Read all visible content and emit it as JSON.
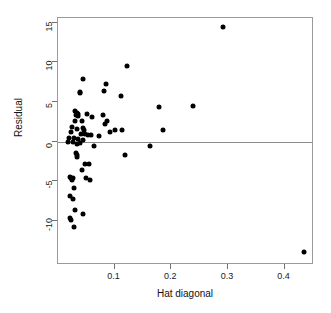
{
  "chart_data": {
    "type": "scatter",
    "title": "",
    "xlabel": "Hat diagonal",
    "ylabel": "Residual",
    "xlim": [
      0.0,
      0.452
    ],
    "ylim": [
      -15.6,
      15.6
    ],
    "xticks": [
      0.1,
      0.2,
      0.3,
      0.4
    ],
    "xtick_labels": [
      "0.1",
      "0.2",
      "0.3",
      "0.4"
    ],
    "yticks": [
      15,
      10,
      5,
      0,
      -5,
      -10
    ],
    "ytick_labels": [
      "15",
      "10",
      "5",
      "0",
      "-5",
      "-10"
    ],
    "grid": false,
    "legend": null,
    "reference_lines": [
      {
        "axis": "y",
        "value": 0,
        "color": "#8c8c8c"
      }
    ],
    "marker": {
      "shape": "circle",
      "filled": true,
      "color": "#000000",
      "size_px": 5
    },
    "points": [
      {
        "x": 0.292,
        "y": 14.5
      },
      {
        "x": 0.122,
        "y": 9.6
      },
      {
        "x": 0.045,
        "y": 7.9
      },
      {
        "x": 0.085,
        "y": 7.3
      },
      {
        "x": 0.039,
        "y": 6.2
      },
      {
        "x": 0.082,
        "y": 6.4
      },
      {
        "x": 0.039,
        "y": 6.1
      },
      {
        "x": 0.112,
        "y": 5.7
      },
      {
        "x": 0.238,
        "y": 4.5
      },
      {
        "x": 0.179,
        "y": 4.3
      },
      {
        "x": 0.03,
        "y": 3.9
      },
      {
        "x": 0.033,
        "y": 3.6
      },
      {
        "x": 0.035,
        "y": 3.5
      },
      {
        "x": 0.051,
        "y": 3.5
      },
      {
        "x": 0.032,
        "y": 3.3
      },
      {
        "x": 0.06,
        "y": 3.1
      },
      {
        "x": 0.036,
        "y": 3.2
      },
      {
        "x": 0.08,
        "y": 3.3
      },
      {
        "x": 0.03,
        "y": 2.6
      },
      {
        "x": 0.042,
        "y": 2.6
      },
      {
        "x": 0.087,
        "y": 2.6
      },
      {
        "x": 0.083,
        "y": 2.2
      },
      {
        "x": 0.024,
        "y": 1.8
      },
      {
        "x": 0.034,
        "y": 1.6
      },
      {
        "x": 0.044,
        "y": 1.7
      },
      {
        "x": 0.046,
        "y": 1.5
      },
      {
        "x": 0.1,
        "y": 1.5
      },
      {
        "x": 0.186,
        "y": 1.5
      },
      {
        "x": 0.113,
        "y": 1.5
      },
      {
        "x": 0.091,
        "y": 1.2
      },
      {
        "x": 0.023,
        "y": 1.2
      },
      {
        "x": 0.04,
        "y": 1.0
      },
      {
        "x": 0.048,
        "y": 0.9
      },
      {
        "x": 0.053,
        "y": 0.8
      },
      {
        "x": 0.058,
        "y": 0.8
      },
      {
        "x": 0.072,
        "y": 0.7
      },
      {
        "x": 0.02,
        "y": 0.5
      },
      {
        "x": 0.028,
        "y": 0.4
      },
      {
        "x": 0.035,
        "y": 0.3
      },
      {
        "x": 0.044,
        "y": 0.2
      },
      {
        "x": 0.018,
        "y": 0.0
      },
      {
        "x": 0.026,
        "y": -0.1
      },
      {
        "x": 0.033,
        "y": -0.3
      },
      {
        "x": 0.038,
        "y": -0.2
      },
      {
        "x": 0.064,
        "y": -0.6
      },
      {
        "x": 0.163,
        "y": -0.6
      },
      {
        "x": 0.031,
        "y": -1.4
      },
      {
        "x": 0.033,
        "y": -1.7
      },
      {
        "x": 0.034,
        "y": -2.0
      },
      {
        "x": 0.118,
        "y": -1.7
      },
      {
        "x": 0.048,
        "y": -2.8
      },
      {
        "x": 0.055,
        "y": -2.9
      },
      {
        "x": 0.042,
        "y": -3.6
      },
      {
        "x": 0.021,
        "y": -4.5
      },
      {
        "x": 0.023,
        "y": -4.6
      },
      {
        "x": 0.024,
        "y": -4.8
      },
      {
        "x": 0.026,
        "y": -4.6
      },
      {
        "x": 0.05,
        "y": -4.6
      },
      {
        "x": 0.057,
        "y": -4.9
      },
      {
        "x": 0.029,
        "y": -5.9
      },
      {
        "x": 0.022,
        "y": -6.9
      },
      {
        "x": 0.026,
        "y": -7.3
      },
      {
        "x": 0.03,
        "y": -8.6
      },
      {
        "x": 0.021,
        "y": -9.7
      },
      {
        "x": 0.023,
        "y": -9.9
      },
      {
        "x": 0.045,
        "y": -9.2
      },
      {
        "x": 0.029,
        "y": -10.8
      },
      {
        "x": 0.435,
        "y": -14.0
      }
    ]
  }
}
